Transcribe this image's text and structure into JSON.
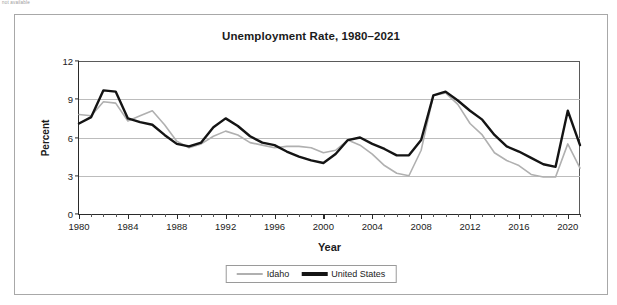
{
  "page": {
    "clipped_header_text": "not available"
  },
  "figure": {
    "title": "Unemployment Rate, 1980–2021",
    "xlabel": "Year",
    "ylabel": "Percent"
  },
  "legend": {
    "position": "bottom-center",
    "entries": [
      {
        "label": "Idaho",
        "color": "#b0b0b0",
        "style": "thin-gray-line"
      },
      {
        "label": "United States",
        "color": "#141414",
        "style": "thick-black-line"
      }
    ]
  },
  "axes": {
    "y_ticks": [
      "0",
      "3",
      "6",
      "9",
      "12"
    ],
    "y_tick_values": [
      0,
      3,
      6,
      9,
      12
    ],
    "x_ticks": [
      "1980",
      "1984",
      "1988",
      "1992",
      "1996",
      "2000",
      "2004",
      "2008",
      "2012",
      "2016",
      "2020"
    ],
    "x_tick_values": [
      1980,
      1984,
      1988,
      1992,
      1996,
      2000,
      2004,
      2008,
      2012,
      2016,
      2020
    ]
  },
  "chart_data": {
    "type": "line",
    "title": "Unemployment Rate, 1980–2021",
    "xlabel": "Year",
    "ylabel": "Percent",
    "xlim": [
      1980,
      2021
    ],
    "ylim": [
      0,
      12
    ],
    "grid": "horizontal",
    "legend_position": "bottom-center",
    "x": [
      1980,
      1981,
      1982,
      1983,
      1984,
      1985,
      1986,
      1987,
      1988,
      1989,
      1990,
      1991,
      1992,
      1993,
      1994,
      1995,
      1996,
      1997,
      1998,
      1999,
      2000,
      2001,
      2002,
      2003,
      2004,
      2005,
      2006,
      2007,
      2008,
      2009,
      2010,
      2011,
      2012,
      2013,
      2014,
      2015,
      2016,
      2017,
      2018,
      2019,
      2020,
      2021
    ],
    "series": [
      {
        "name": "Idaho",
        "color": "#b0b0b0",
        "values": [
          7.8,
          7.7,
          8.8,
          8.7,
          7.3,
          7.7,
          8.1,
          7.0,
          5.7,
          5.2,
          5.5,
          6.1,
          6.5,
          6.2,
          5.6,
          5.4,
          5.2,
          5.3,
          5.3,
          5.2,
          4.8,
          5.0,
          5.8,
          5.4,
          4.7,
          3.8,
          3.2,
          3.0,
          5.0,
          9.3,
          9.5,
          8.6,
          7.1,
          6.2,
          4.8,
          4.2,
          3.8,
          3.1,
          2.9,
          2.9,
          5.5,
          3.6
        ]
      },
      {
        "name": "United States",
        "color": "#141414",
        "values": [
          7.1,
          7.6,
          9.7,
          9.6,
          7.5,
          7.2,
          7.0,
          6.2,
          5.5,
          5.3,
          5.6,
          6.8,
          7.5,
          6.9,
          6.1,
          5.6,
          5.4,
          4.9,
          4.5,
          4.2,
          4.0,
          4.7,
          5.8,
          6.0,
          5.5,
          5.1,
          4.6,
          4.6,
          5.8,
          9.3,
          9.6,
          8.9,
          8.1,
          7.4,
          6.2,
          5.3,
          4.9,
          4.4,
          3.9,
          3.7,
          8.1,
          5.4
        ]
      }
    ]
  }
}
